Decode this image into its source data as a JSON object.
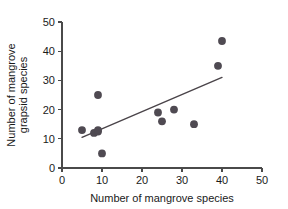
{
  "chart_data": {
    "type": "scatter",
    "title": "",
    "xlabel": "Number of mangrove species",
    "ylabel": "Number of mangrove grapsid species",
    "ylabel_lines": [
      "Number of mangrove",
      "grapsid species"
    ],
    "xlim": [
      0,
      50
    ],
    "ylim": [
      0,
      50
    ],
    "xticks": [
      0,
      10,
      20,
      30,
      40,
      50
    ],
    "yticks": [
      0,
      10,
      20,
      30,
      40,
      50
    ],
    "xtick_labels": [
      "0",
      "10",
      "20",
      "30",
      "40",
      "50"
    ],
    "ytick_labels": [
      "0",
      "10",
      "20",
      "30",
      "40",
      "50"
    ],
    "grid": false,
    "legend": false,
    "marker_color": "#4f4a52",
    "line_color": "#4a4449",
    "axis_color": "#4a4a4a",
    "series": [
      {
        "name": "mangrove sites",
        "points": [
          {
            "x": 5,
            "y": 13
          },
          {
            "x": 8,
            "y": 12
          },
          {
            "x": 9,
            "y": 12.5
          },
          {
            "x": 9,
            "y": 13
          },
          {
            "x": 9,
            "y": 25
          },
          {
            "x": 10,
            "y": 5
          },
          {
            "x": 24,
            "y": 19
          },
          {
            "x": 25,
            "y": 16
          },
          {
            "x": 28,
            "y": 20
          },
          {
            "x": 33,
            "y": 15
          },
          {
            "x": 39,
            "y": 35
          },
          {
            "x": 40,
            "y": 43.5
          }
        ]
      }
    ],
    "trendline": {
      "type": "linear-fit",
      "x_start": 5,
      "y_start": 10.5,
      "x_end": 40,
      "y_end": 31
    }
  }
}
